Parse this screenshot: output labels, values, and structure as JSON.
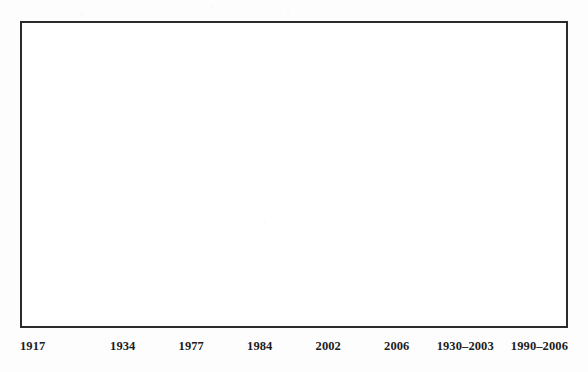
{
  "figure": {
    "name": "empty-plot-figure",
    "frame": {
      "border_color": "#2b2b2b",
      "background_color": "#ffffff",
      "has_content": false
    },
    "page_background": "#fdfdfd",
    "label_color": "#1c1c1c"
  },
  "chart_data": {
    "type": "bar",
    "title": "",
    "subtitle": "",
    "xlabel": "",
    "ylabel": "",
    "categories": [
      "1917",
      "1934",
      "1977",
      "1984",
      "2002",
      "2006",
      "1930–2003",
      "1990–2006"
    ],
    "values": [
      null,
      null,
      null,
      null,
      null,
      null,
      null,
      null
    ],
    "series": [],
    "legend": [],
    "annotations": [],
    "grid": false,
    "legend_position": "none",
    "ylim": [
      null,
      null
    ]
  }
}
